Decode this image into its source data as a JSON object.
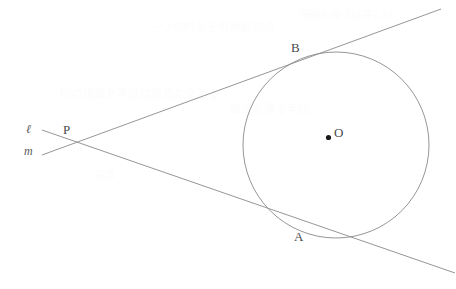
{
  "figure": {
    "width": 456,
    "height": 289,
    "background_color": "#ffffff",
    "stroke_color": "#8a8a8a",
    "label_color": "#4a4a4a",
    "dot_color": "#1a1a1a"
  },
  "labels": {
    "center": "O",
    "tangent_point_upper": "B",
    "tangent_point_lower": "A",
    "external_point": "P",
    "line_upper": "ℓ",
    "line_lower": "m"
  },
  "geometry": {
    "circle": {
      "cx": 336,
      "cy": 145,
      "r": 93
    },
    "center_dot": {
      "cx": 328.5,
      "cy": 137.5,
      "r": 2.6
    },
    "external_point": {
      "x": 68,
      "y": 142
    },
    "tangent_point_upper": {
      "x": 303,
      "y": 60
    },
    "tangent_point_lower": {
      "x": 297,
      "y": 224
    },
    "line_upper": {
      "x1": 42,
      "y1": 155,
      "x2": 441,
      "y2": 9
    },
    "line_lower": {
      "x1": 42,
      "y1": 130,
      "x2": 455,
      "y2": 273
    }
  },
  "label_positions": {
    "center": {
      "left": 334,
      "top": 126
    },
    "tangent_point_upper": {
      "left": 291,
      "top": 41
    },
    "tangent_point_lower": {
      "left": 294,
      "top": 230
    },
    "external_point": {
      "left": 63,
      "top": 123
    },
    "line_upper": {
      "left": 26,
      "top": 123
    },
    "line_lower": {
      "left": 24,
      "top": 145
    }
  },
  "bleed_text": [
    {
      "text": "一つの円とその外部の点",
      "left": 150,
      "top": 18,
      "size": 11
    },
    {
      "text": "接線の長さは等しい",
      "left": 300,
      "top": 6,
      "size": 10
    },
    {
      "text": "円の接線と半径は垂直に交わる",
      "left": 60,
      "top": 85,
      "size": 11
    },
    {
      "text": "接点を通る半径",
      "left": 230,
      "top": 100,
      "size": 11
    },
    {
      "text": "定理",
      "left": 95,
      "top": 166,
      "size": 10
    }
  ]
}
